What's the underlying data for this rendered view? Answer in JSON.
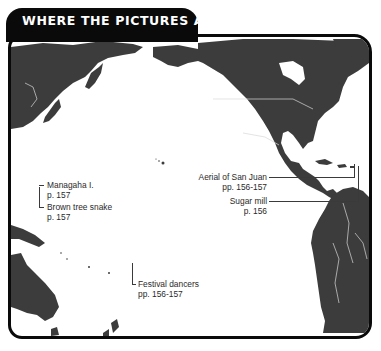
{
  "header": {
    "title": "WHERE THE PICTURES ARE"
  },
  "colors": {
    "land": "#3c3c3c",
    "ocean": "#ffffff",
    "frame": "#0a0a0a",
    "borders": "#d8d8d8",
    "label_text": "#2a2a2a"
  },
  "callouts": [
    {
      "id": "managaha",
      "title": "Managaha I.",
      "pages": "p. 157",
      "side": "left"
    },
    {
      "id": "brown-tree-snake",
      "title": "Brown tree snake",
      "pages": "p. 157",
      "side": "left"
    },
    {
      "id": "festival-dancers",
      "title": "Festival dancers",
      "pages": "pp. 156-157",
      "side": "left"
    },
    {
      "id": "aerial-san-juan",
      "title": "Aerial of San Juan",
      "pages": "pp. 156-157",
      "side": "right"
    },
    {
      "id": "sugar-mill",
      "title": "Sugar mill",
      "pages": "p. 156",
      "side": "right"
    }
  ],
  "regions": [
    "Asia",
    "North America",
    "Central America",
    "Caribbean",
    "South America",
    "Australia",
    "New Guinea",
    "New Zealand",
    "Hawaii",
    "Pacific Ocean"
  ]
}
